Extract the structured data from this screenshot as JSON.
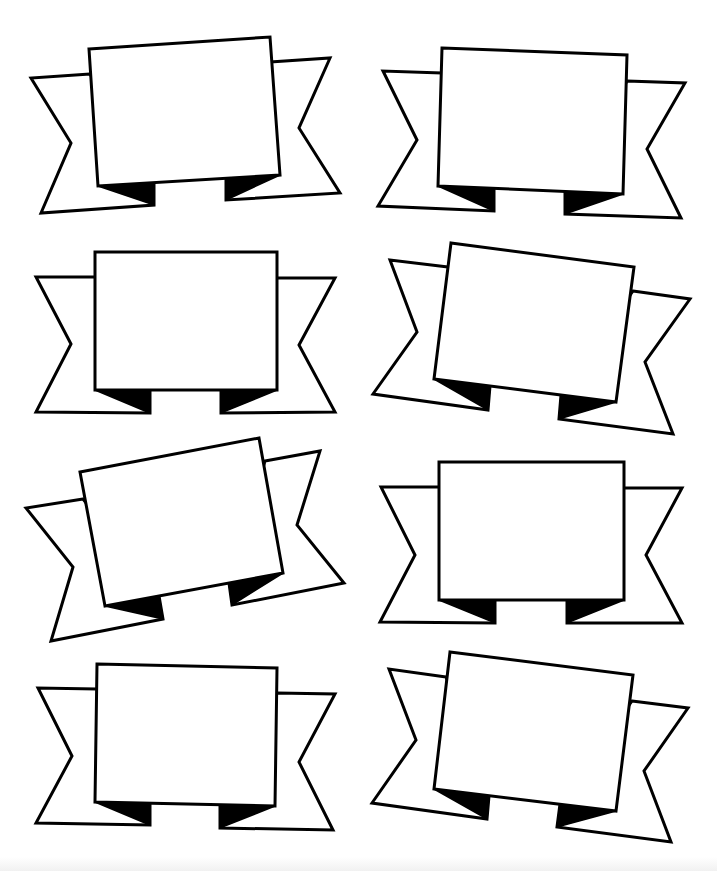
{
  "sheet": {
    "title": "",
    "background": "#ffffff",
    "stroke_color": "#000000",
    "banner_count": 8
  },
  "banners": [
    {
      "id": "banner-1",
      "position": "row1-left",
      "left_ribbon": [
        [
          90,
          74
        ],
        [
          31,
          78
        ],
        [
          71,
          143
        ],
        [
          41,
          213
        ],
        [
          154,
          205
        ],
        [
          154,
          182
        ]
      ],
      "right_ribbon": [
        [
          270,
          62
        ],
        [
          330,
          58
        ],
        [
          299,
          128
        ],
        [
          340,
          193
        ],
        [
          226,
          200
        ],
        [
          226,
          177
        ]
      ],
      "left_fold": [
        [
          98,
          186
        ],
        [
          154,
          182
        ],
        [
          154,
          205
        ]
      ],
      "right_fold": [
        [
          226,
          177
        ],
        [
          280,
          175
        ],
        [
          226,
          200
        ]
      ],
      "panel": [
        [
          89,
          49
        ],
        [
          270,
          37
        ],
        [
          280,
          175
        ],
        [
          98,
          186
        ]
      ]
    },
    {
      "id": "banner-2",
      "position": "row1-right",
      "left_ribbon": [
        [
          442,
          73
        ],
        [
          383,
          71
        ],
        [
          417,
          140
        ],
        [
          378,
          206
        ],
        [
          494,
          211
        ],
        [
          494,
          189
        ]
      ],
      "right_ribbon": [
        [
          627,
          81
        ],
        [
          685,
          83
        ],
        [
          647,
          149
        ],
        [
          681,
          218
        ],
        [
          565,
          214
        ],
        [
          565,
          192
        ]
      ],
      "left_fold": [
        [
          438,
          186
        ],
        [
          494,
          189
        ],
        [
          494,
          211
        ]
      ],
      "right_fold": [
        [
          565,
          192
        ],
        [
          623,
          194
        ],
        [
          565,
          214
        ]
      ],
      "panel": [
        [
          442,
          48
        ],
        [
          627,
          55
        ],
        [
          623,
          194
        ],
        [
          438,
          186
        ]
      ]
    },
    {
      "id": "banner-3",
      "position": "row2-left",
      "left_ribbon": [
        [
          95,
          277
        ],
        [
          36,
          277
        ],
        [
          71,
          344
        ],
        [
          36,
          412
        ],
        [
          150,
          413
        ],
        [
          150,
          390
        ]
      ],
      "right_ribbon": [
        [
          277,
          278
        ],
        [
          335,
          278
        ],
        [
          299,
          345
        ],
        [
          335,
          412
        ],
        [
          221,
          413
        ],
        [
          221,
          390
        ]
      ],
      "left_fold": [
        [
          95,
          390
        ],
        [
          150,
          390
        ],
        [
          150,
          413
        ]
      ],
      "right_fold": [
        [
          221,
          390
        ],
        [
          277,
          390
        ],
        [
          221,
          413
        ]
      ],
      "panel": [
        [
          95,
          252
        ],
        [
          277,
          252
        ],
        [
          277,
          390
        ],
        [
          95,
          390
        ]
      ]
    },
    {
      "id": "banner-4",
      "position": "row2-right",
      "left_ribbon": [
        [
          448,
          267
        ],
        [
          390,
          260
        ],
        [
          417,
          332
        ],
        [
          373,
          394
        ],
        [
          488,
          410
        ],
        [
          490,
          386
        ]
      ],
      "right_ribbon": [
        [
          633,
          291
        ],
        [
          690,
          299
        ],
        [
          645,
          362
        ],
        [
          673,
          434
        ],
        [
          559,
          419
        ],
        [
          561,
          395
        ]
      ],
      "left_fold": [
        [
          434,
          379
        ],
        [
          490,
          386
        ],
        [
          488,
          410
        ]
      ],
      "right_fold": [
        [
          561,
          395
        ],
        [
          616,
          402
        ],
        [
          559,
          419
        ]
      ],
      "panel": [
        [
          451,
          243
        ],
        [
          634,
          267
        ],
        [
          616,
          402
        ],
        [
          434,
          379
        ]
      ]
    },
    {
      "id": "banner-5",
      "position": "row3-left",
      "left_ribbon": [
        [
          83,
          499
        ],
        [
          26,
          508
        ],
        [
          73,
          567
        ],
        [
          51,
          641
        ],
        [
          163,
          619
        ],
        [
          159,
          596
        ]
      ],
      "right_ribbon": [
        [
          265,
          461
        ],
        [
          320,
          451
        ],
        [
          297,
          525
        ],
        [
          344,
          583
        ],
        [
          232,
          605
        ],
        [
          229,
          583
        ]
      ],
      "left_fold": [
        [
          105,
          606
        ],
        [
          159,
          596
        ],
        [
          163,
          619
        ]
      ],
      "right_fold": [
        [
          229,
          583
        ],
        [
          283,
          573
        ],
        [
          232,
          605
        ]
      ],
      "panel": [
        [
          80,
          472
        ],
        [
          259,
          438
        ],
        [
          283,
          573
        ],
        [
          105,
          606
        ]
      ]
    },
    {
      "id": "banner-6",
      "position": "row3-right",
      "left_ribbon": [
        [
          439,
          487
        ],
        [
          381,
          487
        ],
        [
          415,
          555
        ],
        [
          380,
          622
        ],
        [
          495,
          623
        ],
        [
          495,
          600
        ]
      ],
      "right_ribbon": [
        [
          624,
          488
        ],
        [
          682,
          488
        ],
        [
          646,
          555
        ],
        [
          682,
          623
        ],
        [
          567,
          623
        ],
        [
          567,
          600
        ]
      ],
      "left_fold": [
        [
          439,
          600
        ],
        [
          495,
          600
        ],
        [
          495,
          623
        ]
      ],
      "right_fold": [
        [
          567,
          600
        ],
        [
          624,
          600
        ],
        [
          567,
          623
        ]
      ],
      "panel": [
        [
          439,
          462
        ],
        [
          624,
          462
        ],
        [
          624,
          600
        ],
        [
          439,
          600
        ]
      ]
    },
    {
      "id": "banner-7",
      "position": "row4-left",
      "left_ribbon": [
        [
          97,
          689
        ],
        [
          38,
          688
        ],
        [
          72,
          756
        ],
        [
          36,
          823
        ],
        [
          150,
          825
        ],
        [
          150,
          803
        ]
      ],
      "right_ribbon": [
        [
          277,
          693
        ],
        [
          335,
          694
        ],
        [
          299,
          762
        ],
        [
          333,
          830
        ],
        [
          220,
          828
        ],
        [
          220,
          805
        ]
      ],
      "left_fold": [
        [
          95,
          802
        ],
        [
          150,
          803
        ],
        [
          150,
          825
        ]
      ],
      "right_fold": [
        [
          220,
          805
        ],
        [
          275,
          806
        ],
        [
          220,
          828
        ]
      ],
      "panel": [
        [
          97,
          664
        ],
        [
          277,
          668
        ],
        [
          275,
          806
        ],
        [
          95,
          802
        ]
      ]
    },
    {
      "id": "banner-8",
      "position": "row4-right",
      "left_ribbon": [
        [
          446,
          677
        ],
        [
          389,
          669
        ],
        [
          416,
          740
        ],
        [
          372,
          803
        ],
        [
          487,
          819
        ],
        [
          489,
          796
        ]
      ],
      "right_ribbon": [
        [
          632,
          701
        ],
        [
          688,
          708
        ],
        [
          644,
          771
        ],
        [
          671,
          842
        ],
        [
          557,
          827
        ],
        [
          560,
          804
        ]
      ],
      "left_fold": [
        [
          434,
          789
        ],
        [
          489,
          796
        ],
        [
          487,
          819
        ]
      ],
      "right_fold": [
        [
          560,
          804
        ],
        [
          616,
          811
        ],
        [
          557,
          827
        ]
      ],
      "panel": [
        [
          450,
          652
        ],
        [
          633,
          675
        ],
        [
          616,
          811
        ],
        [
          434,
          789
        ]
      ]
    }
  ]
}
